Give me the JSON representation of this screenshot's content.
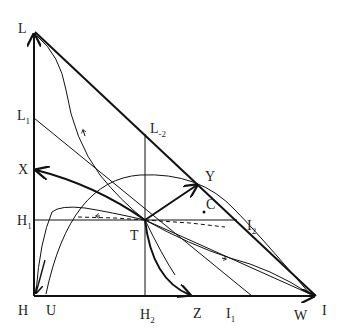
{
  "diagram": {
    "type": "ternary-phase-portrait",
    "labels": {
      "L": "L",
      "L1": "L",
      "L1_sub": "1",
      "L2": "L",
      "L2_sub": "-2",
      "X": "X",
      "H1": "H",
      "H1_sub": "1",
      "T": "T",
      "H": "H",
      "U": "U",
      "H2": "H",
      "H2_sub": "2",
      "Z": "Z",
      "I1": "I",
      "I1_sub": "1",
      "W": "W",
      "I": "I",
      "C": "C",
      "Y": "Y",
      "I2": "I",
      "I2_sub": "2"
    },
    "colors": {
      "stroke": "#111111",
      "background": "#ffffff"
    }
  }
}
